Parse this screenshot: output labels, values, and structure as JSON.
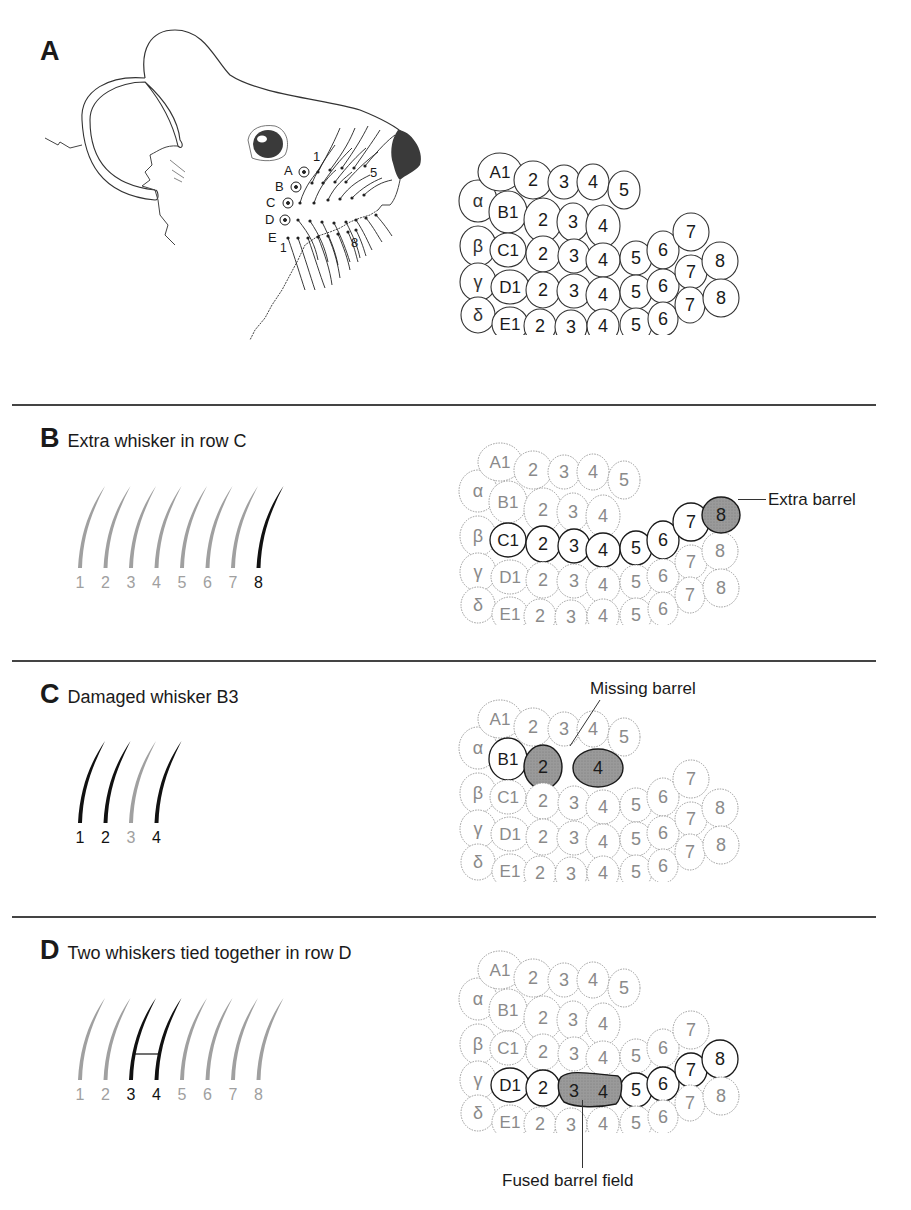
{
  "panels": {
    "A": {
      "letter": "A",
      "mouse": {
        "row_labels": [
          "A",
          "B",
          "C",
          "D",
          "E"
        ],
        "arc_labels": {
          "first_a": "1",
          "last_a": "5",
          "first_e": "1",
          "last_e": "8"
        }
      }
    },
    "B": {
      "letter": "B",
      "title": "Extra whisker in row C",
      "whiskers": [
        "1",
        "2",
        "3",
        "4",
        "5",
        "6",
        "7",
        "8"
      ],
      "highlighted_whiskers": [
        "8"
      ],
      "annotation": "Extra barrel"
    },
    "C": {
      "letter": "C",
      "title": "Damaged whisker B3",
      "whiskers": [
        "1",
        "2",
        "3",
        "4"
      ],
      "dimmed_whiskers": [
        "3"
      ],
      "annotation": "Missing barrel"
    },
    "D": {
      "letter": "D",
      "title": "Two whiskers tied together in row D",
      "whiskers": [
        "1",
        "2",
        "3",
        "4",
        "5",
        "6",
        "7",
        "8"
      ],
      "highlighted_whiskers": [
        "3",
        "4"
      ],
      "annotation": "Fused barrel field"
    }
  },
  "barrel_map": {
    "straddlers": [
      "α",
      "β",
      "γ",
      "δ"
    ],
    "rows": {
      "A": [
        "A1",
        "2",
        "3",
        "4",
        "5"
      ],
      "B": [
        "B1",
        "2",
        "3",
        "4"
      ],
      "C": [
        "C1",
        "2",
        "3",
        "4",
        "5",
        "6",
        "7"
      ],
      "D": [
        "D1",
        "2",
        "3",
        "4",
        "5",
        "6",
        "7",
        "8"
      ],
      "E": [
        "E1",
        "2",
        "3",
        "4",
        "5",
        "6",
        "7",
        "8"
      ]
    }
  },
  "colors": {
    "ink": "#1a1a1a",
    "dim": "#9a9a9a",
    "fill_shaded": "#8c8c8c",
    "nose": "#3a3a3a"
  }
}
